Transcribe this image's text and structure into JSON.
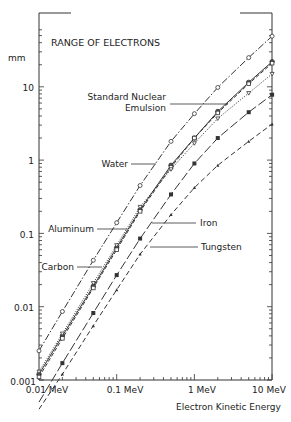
{
  "chart_data": {
    "type": "line",
    "title": "RANGE OF ELECTRONS",
    "xlabel": "Electron Kinetic Energy",
    "ylabel": "mm",
    "xscale": "log",
    "yscale": "log",
    "xlim": [
      0.01,
      10
    ],
    "ylim": [
      0.001,
      60
    ],
    "x_ticks": [
      "0.01 MeV",
      "0.1 MeV",
      "1 MeV",
      "10 MeV"
    ],
    "y_ticks": [
      "0.001",
      "0.01",
      "0.1",
      "1",
      "10"
    ],
    "grid": false,
    "legend": "inline labels with leader lines",
    "x": [
      0.01,
      0.02,
      0.05,
      0.1,
      0.2,
      0.5,
      1,
      2,
      5,
      10
    ],
    "series": [
      {
        "name": "Water",
        "marker": "open-circle",
        "line": "dash-dot",
        "values": [
          0.0025,
          0.0086,
          0.043,
          0.14,
          0.45,
          1.8,
          4.3,
          9.8,
          25,
          49
        ]
      },
      {
        "name": "Standard Nuclear Emulsion",
        "marker": "half-filled-circle",
        "line": "solid",
        "values": [
          0.0012,
          0.004,
          0.019,
          0.064,
          0.21,
          0.85,
          2.0,
          4.6,
          11.5,
          22
        ]
      },
      {
        "name": "Aluminum",
        "marker": "open-square",
        "line": "dashed",
        "values": [
          0.0011,
          0.0037,
          0.018,
          0.06,
          0.2,
          0.8,
          2.0,
          4.4,
          11,
          21
        ]
      },
      {
        "name": "Carbon",
        "marker": "open-triangle",
        "line": "dotted",
        "values": [
          0.0013,
          0.0043,
          0.021,
          0.069,
          0.23,
          0.75,
          1.7,
          3.7,
          8.2,
          15
        ]
      },
      {
        "name": "Iron",
        "marker": "filled-square",
        "line": "long-dash",
        "values": [
          0.0005,
          0.0017,
          0.0082,
          0.027,
          0.085,
          0.34,
          0.9,
          2.0,
          4.5,
          7.8
        ]
      },
      {
        "name": "Tungsten",
        "marker": "filled-triangle",
        "line": "dashed",
        "values": [
          0.0004,
          0.0012,
          0.0055,
          0.017,
          0.052,
          0.18,
          0.42,
          0.85,
          1.8,
          3.1
        ]
      }
    ],
    "annotations": [
      "Standard Nuclear Emulsion",
      "Water",
      "Aluminum",
      "Carbon",
      "Iron",
      "Tungsten"
    ]
  },
  "labels": {
    "title": "RANGE OF ELECTRONS",
    "y_unit": "mm",
    "x_axis_title": "Electron Kinetic Energy",
    "y_ticks": [
      "10",
      "1",
      "0.1",
      "0.01",
      "0.001"
    ],
    "x_ticks": [
      "0.01 MeV",
      "0.1 MeV",
      "1 MeV",
      "10 MeV"
    ],
    "emulsion_line1": "Standard Nuclear",
    "emulsion_line2": "Emulsion",
    "water": "Water",
    "aluminum": "Aluminum",
    "carbon": "Carbon",
    "iron": "Iron",
    "tungsten": "Tungsten"
  }
}
